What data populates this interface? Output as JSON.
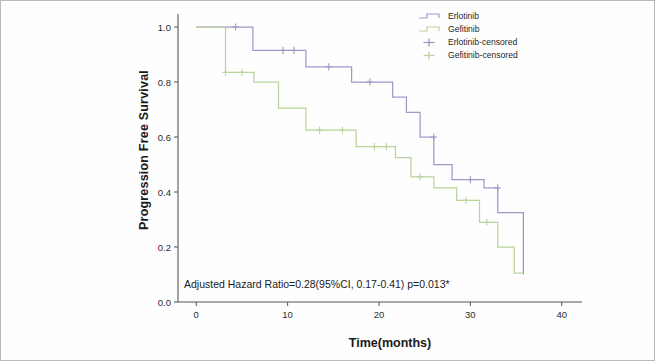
{
  "chart_data": {
    "type": "line",
    "subtype": "kaplan-meier-step",
    "title": "",
    "xlabel": "Time(months)",
    "ylabel": "Progression Free Survival",
    "xlim": [
      -2,
      42
    ],
    "ylim": [
      0.0,
      1.04
    ],
    "xticks": [
      0,
      10,
      20,
      30,
      40
    ],
    "xtick_labels": [
      "0",
      "10",
      "20",
      "30",
      "40"
    ],
    "yticks": [
      0.0,
      0.2,
      0.4,
      0.6,
      0.8,
      1.0
    ],
    "ytick_labels": [
      "0.0",
      "0.2",
      "0.4",
      "0.6",
      "0.8",
      "1.0"
    ],
    "grid": false,
    "legend_position": "top-right",
    "annotation": "Adjusted Hazard Ratio=0.28(95%CI, 0.17-0.41) p=0.013*",
    "colors": {
      "erlotinib": "#9a9ac8",
      "gefitinib": "#b9d49a",
      "axis": "#555555",
      "text": "#1a1a1a"
    },
    "series": [
      {
        "name": "Erlotinib",
        "color": "#9a9ac8",
        "steps": [
          [
            0,
            1.0
          ],
          [
            6.2,
            1.0
          ],
          [
            6.2,
            0.915
          ],
          [
            12.0,
            0.915
          ],
          [
            12.0,
            0.855
          ],
          [
            17.0,
            0.855
          ],
          [
            17.0,
            0.8
          ],
          [
            21.5,
            0.8
          ],
          [
            21.5,
            0.745
          ],
          [
            23.0,
            0.745
          ],
          [
            23.0,
            0.69
          ],
          [
            24.5,
            0.69
          ],
          [
            24.5,
            0.6
          ],
          [
            26.0,
            0.6
          ],
          [
            26.0,
            0.5
          ],
          [
            28.0,
            0.5
          ],
          [
            28.0,
            0.445
          ],
          [
            31.5,
            0.445
          ],
          [
            31.5,
            0.415
          ],
          [
            33.0,
            0.415
          ],
          [
            33.0,
            0.325
          ],
          [
            35.8,
            0.325
          ],
          [
            35.8,
            0.1
          ]
        ],
        "censored": [
          [
            4.3,
            1.0
          ],
          [
            9.5,
            0.915
          ],
          [
            10.7,
            0.915
          ],
          [
            14.5,
            0.855
          ],
          [
            19.0,
            0.8
          ],
          [
            26.0,
            0.6
          ],
          [
            30.0,
            0.445
          ],
          [
            33.0,
            0.415
          ]
        ]
      },
      {
        "name": "Gefitinib",
        "color": "#b9d49a",
        "steps": [
          [
            0,
            1.0
          ],
          [
            3.2,
            1.0
          ],
          [
            3.2,
            0.835
          ],
          [
            6.3,
            0.835
          ],
          [
            6.3,
            0.8
          ],
          [
            9.0,
            0.8
          ],
          [
            9.0,
            0.705
          ],
          [
            12.0,
            0.705
          ],
          [
            12.0,
            0.625
          ],
          [
            17.5,
            0.625
          ],
          [
            17.5,
            0.565
          ],
          [
            21.8,
            0.565
          ],
          [
            21.8,
            0.525
          ],
          [
            23.5,
            0.525
          ],
          [
            23.5,
            0.455
          ],
          [
            26.0,
            0.455
          ],
          [
            26.0,
            0.415
          ],
          [
            28.5,
            0.415
          ],
          [
            28.5,
            0.37
          ],
          [
            31.0,
            0.37
          ],
          [
            31.0,
            0.29
          ],
          [
            33.0,
            0.29
          ],
          [
            33.0,
            0.2
          ],
          [
            34.8,
            0.2
          ],
          [
            34.8,
            0.105
          ],
          [
            35.8,
            0.105
          ]
        ],
        "censored": [
          [
            3.2,
            0.835
          ],
          [
            5.0,
            0.835
          ],
          [
            13.5,
            0.625
          ],
          [
            16.0,
            0.625
          ],
          [
            19.5,
            0.565
          ],
          [
            20.8,
            0.565
          ],
          [
            24.5,
            0.455
          ],
          [
            29.5,
            0.37
          ],
          [
            31.8,
            0.29
          ]
        ]
      }
    ],
    "legend": [
      {
        "label": "Erlotinib",
        "color": "#9a9ac8",
        "glyph": "step-line"
      },
      {
        "label": "Gefitinib",
        "color": "#b9d49a",
        "glyph": "step-line"
      },
      {
        "label": "Erlotinib-censored",
        "color": "#9a9ac8",
        "glyph": "plus-mark"
      },
      {
        "label": "Gefitinib-censored",
        "color": "#b9d49a",
        "glyph": "plus-mark"
      }
    ]
  }
}
